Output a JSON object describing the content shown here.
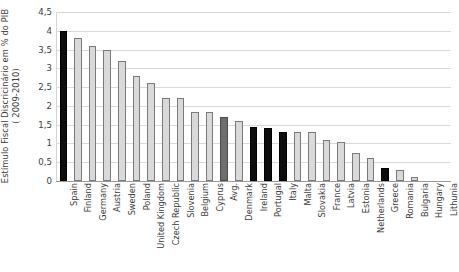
{
  "chart_data": {
    "type": "bar",
    "title": "",
    "xlabel": "",
    "ylabel": "Estímulo Fiscal Discricinário em  % do PIB ( 2009-2010)",
    "ylabel_line1": "Estímulo Fiscal Discricinário em  % do PIB",
    "ylabel_line2": "( 2009-2010)",
    "ylim": [
      0,
      4.5
    ],
    "ytick_labels": [
      "0",
      "0,5",
      "1",
      "1,5",
      "2",
      "2,5",
      "3",
      "3,5",
      "4",
      "4,5"
    ],
    "ytick_values": [
      0,
      0.5,
      1,
      1.5,
      2,
      2.5,
      3,
      3.5,
      4,
      4.5
    ],
    "grid": true,
    "legend": "none",
    "decimal_separator": ",",
    "categories": [
      "Spain",
      "Finland",
      "Germany",
      "Austria",
      "Sweden",
      "Poland",
      "United Kingdom",
      "Czech Republic",
      "Slovenia",
      "Belgium",
      "Cyprus",
      "Avg.",
      "Denmark",
      "Ireland",
      "Portugal",
      "Italy",
      "Malta",
      "Slovakia",
      "France",
      "Latvia",
      "Estonia",
      "Netherlands",
      "Greece",
      "Romania",
      "Bulgaria",
      "Hungary",
      "Lithunia"
    ],
    "values": [
      4.0,
      3.8,
      3.6,
      3.5,
      3.2,
      2.8,
      2.6,
      2.2,
      2.2,
      1.85,
      1.85,
      1.7,
      1.6,
      1.45,
      1.4,
      1.3,
      1.3,
      1.3,
      1.1,
      1.05,
      0.75,
      0.6,
      0.35,
      0.3,
      0.1,
      0.0,
      0.0
    ],
    "bar_styles": [
      "dark",
      "light",
      "light",
      "light",
      "light",
      "light",
      "light",
      "light",
      "light",
      "light",
      "light",
      "mid",
      "light",
      "dark",
      "dark",
      "dark",
      "light",
      "light",
      "light",
      "light",
      "light",
      "light",
      "dark",
      "light",
      "light",
      "light",
      "light"
    ],
    "colors": {
      "light_bar": "#d9d9d9",
      "mid_bar": "#6e6e6e",
      "dark_bar": "#0d0d0d",
      "bar_border": "#6f6f6f",
      "gridline": "#d9d9d9",
      "axis": "#9a9a9a",
      "text": "#3b3b3b",
      "background": "#ffffff"
    }
  }
}
